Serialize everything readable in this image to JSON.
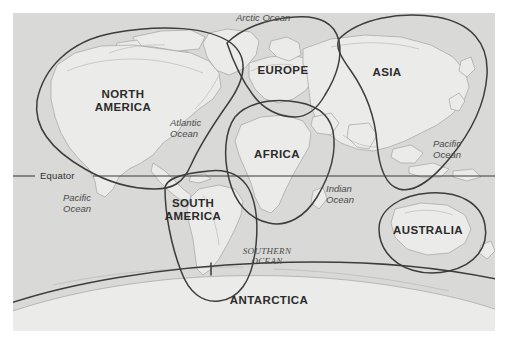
{
  "map": {
    "title": "World map with continent and ocean regions",
    "background_color": "#d9d9d7",
    "land_color": "#e9e9e7",
    "boundary_color": "#3a3a3a",
    "coastline_color": "#9a9a98",
    "frame": {
      "x": 13,
      "y": 13,
      "width": 482,
      "height": 318
    },
    "continents": [
      {
        "id": "north-america",
        "label": "NORTH\nAMERICA",
        "line1": "NORTH",
        "line2": "AMERICA",
        "x": 110,
        "y": 88
      },
      {
        "id": "south-america",
        "label": "SOUTH\nAMERICA",
        "line1": "SOUTH",
        "line2": "AMERICA",
        "x": 180,
        "y": 197
      },
      {
        "id": "europe",
        "label": "EUROPE",
        "line1": "EUROPE",
        "line2": "",
        "x": 270,
        "y": 71
      },
      {
        "id": "africa",
        "label": "AFRICA",
        "line1": "AFRICA",
        "line2": "",
        "x": 264,
        "y": 155
      },
      {
        "id": "asia",
        "label": "ASIA",
        "line1": "ASIA",
        "line2": "",
        "x": 374,
        "y": 73
      },
      {
        "id": "australia",
        "label": "AUSTRALIA",
        "line1": "AUSTRALIA",
        "line2": "",
        "x": 413,
        "y": 231
      },
      {
        "id": "antarctica",
        "label": "ANTARCTICA",
        "line1": "ANTARCTICA",
        "line2": "",
        "x": 254,
        "y": 301
      }
    ],
    "oceans": [
      {
        "id": "arctic-ocean",
        "line1": "Arctic Ocean",
        "line2": "",
        "x": 236,
        "y": 12
      },
      {
        "id": "atlantic-ocean",
        "line1": "Atlantic",
        "line2": "Ocean",
        "x": 170,
        "y": 117
      },
      {
        "id": "pacific-ocean-west",
        "line1": "Pacific",
        "line2": "Ocean",
        "x": 63,
        "y": 192
      },
      {
        "id": "pacific-ocean-east",
        "line1": "Pacific",
        "line2": "Ocean",
        "x": 433,
        "y": 138
      },
      {
        "id": "indian-ocean",
        "line1": "Indian",
        "line2": "Ocean",
        "x": 326,
        "y": 183
      },
      {
        "id": "southern-ocean",
        "line1": "SOUTHERN",
        "line2": "OCEAN",
        "x": 246,
        "y": 246
      }
    ],
    "equator": {
      "label": "Equator",
      "label_x": 42,
      "label_y": 171,
      "line_y": 176
    }
  }
}
